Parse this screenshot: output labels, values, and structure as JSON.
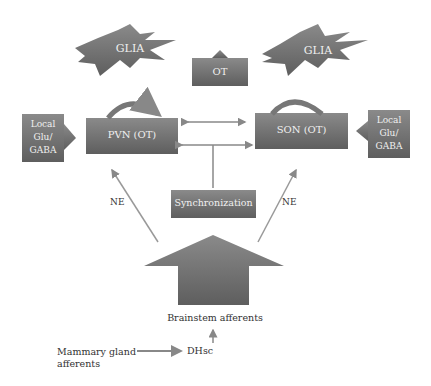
{
  "diagram": {
    "glia_left": "GLIA",
    "glia_right": "GLIA",
    "ot_box": "OT",
    "pvn": "PVN (OT)",
    "son": "SON (OT)",
    "local_left": [
      "Local",
      "Glu/",
      "GABA"
    ],
    "local_right": [
      "Local",
      "Glu/",
      "GABA"
    ],
    "sync": "Synchronization",
    "ne_left": "NE",
    "ne_right": "NE",
    "brainstem": "Brainstem afferents",
    "mammary": [
      "Mammary gland",
      "afferents"
    ],
    "dhsc": "DHsc"
  },
  "colors": {
    "box": "#7a7a7a",
    "arrow": "#8a8a8a",
    "text": "#333333"
  }
}
